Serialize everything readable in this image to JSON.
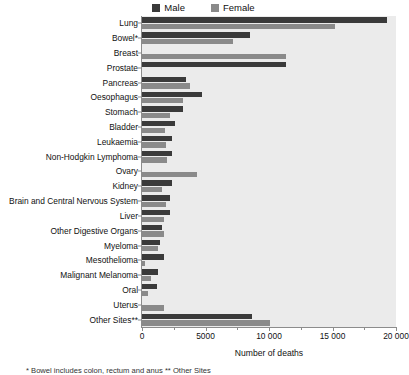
{
  "chart_data": {
    "type": "bar",
    "orientation": "horizontal",
    "title": "",
    "xlabel": "Number of deaths",
    "ylabel": "",
    "xlim": [
      0,
      20000
    ],
    "xticks": [
      0,
      5000,
      10000,
      15000,
      20000
    ],
    "xtick_labels": [
      "0",
      "5000",
      "10 000",
      "15 000",
      "20 000"
    ],
    "xminor_ticks": [
      2500,
      7500,
      12500,
      17500
    ],
    "grid": false,
    "legend_position": "top-center",
    "categories": [
      "Lung",
      "Bowel*",
      "Breast",
      "Prostate",
      "Pancreas",
      "Oesophagus",
      "Stomach",
      "Bladder",
      "Leukaemia",
      "Non-Hodgkin Lymphoma",
      "Ovary",
      "Kidney",
      "Brain and Central Nervous System",
      "Liver",
      "Other Digestive Organs",
      "Myeloma",
      "Mesothelioma",
      "Malignant Melanoma",
      "Oral",
      "Uterus",
      "Other Sites**"
    ],
    "series": [
      {
        "name": "Male",
        "color": "#3a3a3a",
        "values": [
          19300,
          8500,
          0,
          11300,
          3500,
          4700,
          3200,
          2600,
          2400,
          2400,
          0,
          2400,
          2200,
          2200,
          1600,
          1400,
          1700,
          1250,
          1200,
          0,
          8700
        ]
      },
      {
        "name": "Female",
        "color": "#8a8a8a",
        "values": [
          15200,
          7200,
          11300,
          0,
          3800,
          3200,
          2200,
          1800,
          1900,
          2000,
          4300,
          1600,
          1900,
          1700,
          1700,
          1250,
          200,
          700,
          500,
          1750,
          10100
        ]
      }
    ],
    "footnote": "* Bowel includes colon, rectum and anus    ** Other Sites"
  },
  "legend": {
    "entries": [
      {
        "label": "Male",
        "color": "#3a3a3a"
      },
      {
        "label": "Female",
        "color": "#8a8a8a"
      }
    ]
  },
  "colors": {
    "plot_background": "#ebebeb",
    "axis": "#8c8c8c",
    "text": "#111111"
  }
}
